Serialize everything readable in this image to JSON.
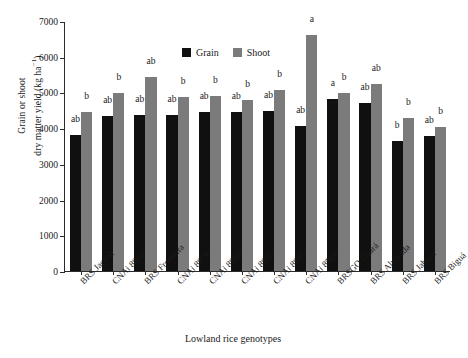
{
  "chart_data": {
    "type": "bar",
    "title": "",
    "xlabel": "Lowland rice genotypes",
    "ylabel_line1": "Grain or shoot",
    "ylabel_line2": "dry matter yield (kg ha",
    "ylabel_exp": "−1",
    "ylabel_close": ")",
    "ylabel_full": "Grain or shoot dry matter yield (kg ha−1)",
    "ylim": [
      0,
      7000
    ],
    "yticks": [
      0,
      1000,
      2000,
      3000,
      4000,
      5000,
      6000,
      7000
    ],
    "ytick_labels": [
      "0",
      "1000",
      "2000",
      "3000",
      "4000",
      "5000",
      "6000",
      "7000"
    ],
    "grid": false,
    "legend_position": "top-left-inside",
    "categories": [
      "BRS Jaçanã",
      "CNAi 8860",
      "BRS Fronteira",
      "CNAi 8879",
      "CNAi 8880",
      "CNAi 8886",
      "CNAi 8885",
      "CNAi 8569",
      "BRSGO Guará",
      "BRS Alvorada",
      "BRS Jaburu",
      "BRS Biguá"
    ],
    "series": [
      {
        "name": "Grain",
        "color": "#101010",
        "values": [
          3820,
          4330,
          4370,
          4370,
          4460,
          4440,
          4490,
          4050,
          4820,
          4700,
          3630,
          3770
        ],
        "annotations": [
          "ab",
          "ab",
          "ab",
          "ab",
          "ab",
          "ab",
          "ab",
          "ab",
          "a",
          "ab",
          "b",
          "ab"
        ]
      },
      {
        "name": "Shoot",
        "color": "#7b7b7b",
        "values": [
          4460,
          4990,
          5440,
          4880,
          4910,
          4790,
          5070,
          6600,
          4990,
          5230,
          4290,
          4030
        ],
        "annotations": [
          "b",
          "b",
          "ab",
          "b",
          "b",
          "b",
          "b",
          "a",
          "b",
          "ab",
          "b",
          "b"
        ]
      }
    ]
  },
  "legend": {
    "items": [
      {
        "label": "Grain",
        "color": "#101010"
      },
      {
        "label": "Shoot",
        "color": "#7b7b7b"
      }
    ]
  }
}
